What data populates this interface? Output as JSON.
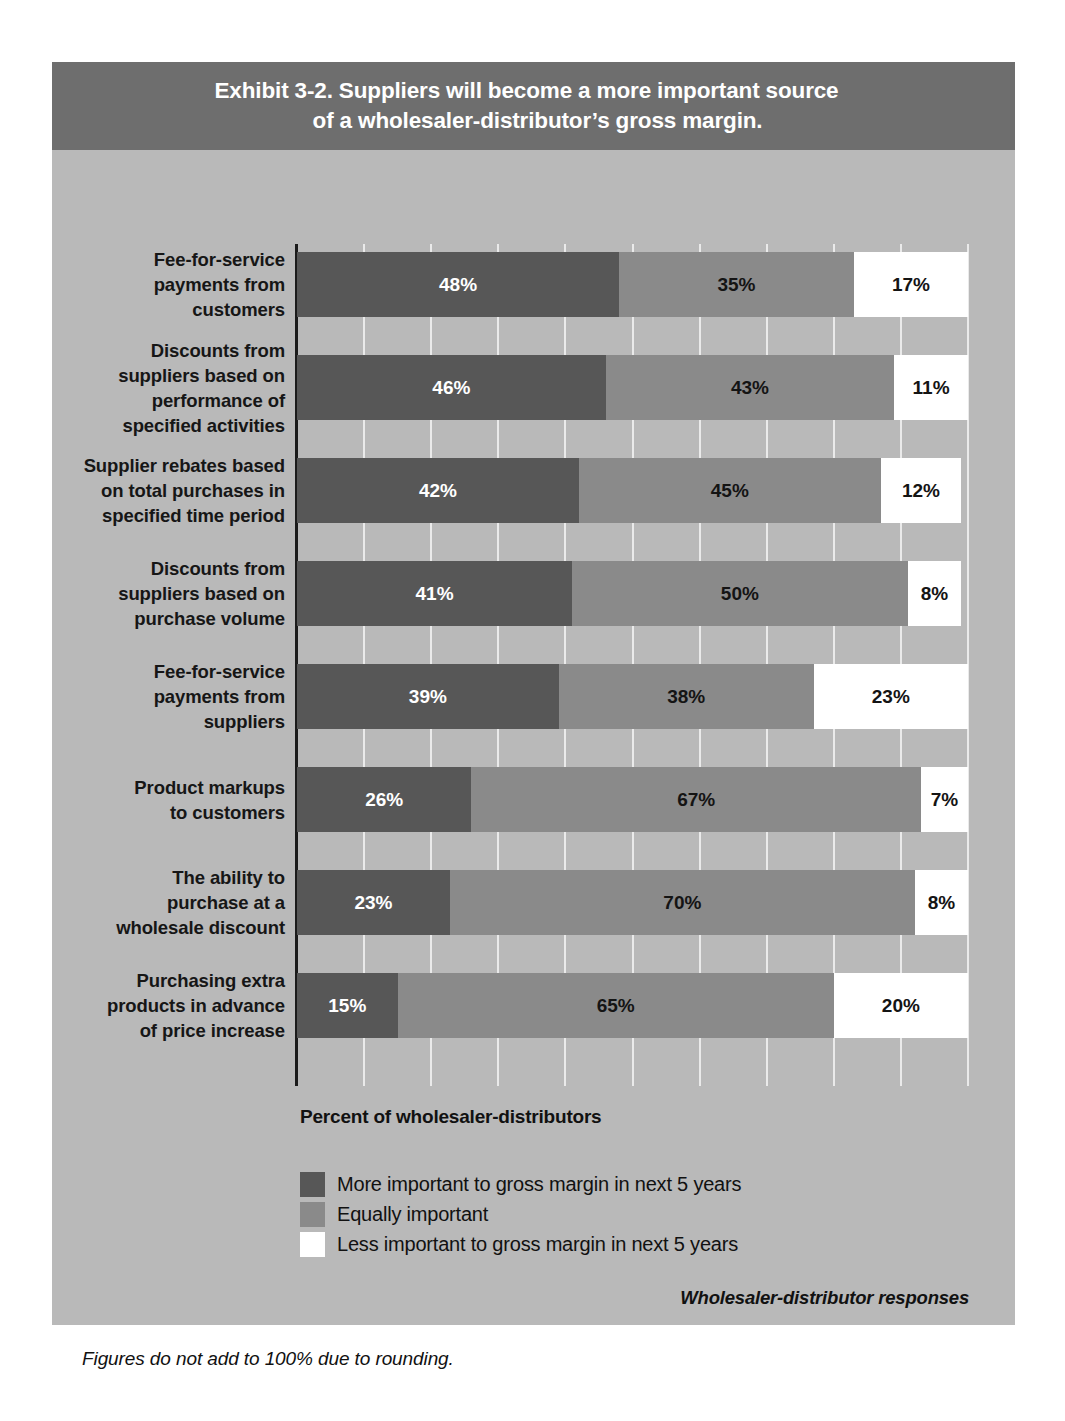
{
  "exhibit": {
    "title_line_1": "Exhibit 3-2. Suppliers will become a more important source",
    "title_line_2": "of a wholesaler-distributor’s gross margin.",
    "axis_caption": "Percent of wholesaler-distributors",
    "source_note": "Wholesaler-distributor responses",
    "rounding_note": "Figures do not add to 100% due to rounding."
  },
  "colors": {
    "panel_background": "#b9b9b9",
    "title_band": "#6e6e6e",
    "more_important": "#575757",
    "equally_important": "#8a8a8a",
    "less_important": "#ffffff",
    "gridline": "#eaeaea",
    "axis_line": "#1b1b1b"
  },
  "legend": {
    "items": [
      {
        "label": "More important to gross margin in next 5 years",
        "color": "#575757"
      },
      {
        "label": "Equally important",
        "color": "#8a8a8a"
      },
      {
        "label": "Less important to gross margin in next 5 years",
        "color": "#ffffff"
      }
    ]
  },
  "chart_data": {
    "type": "bar",
    "orientation": "horizontal",
    "stacked": true,
    "title": "Exhibit 3-2. Suppliers will become a more important source of a wholesaler-distributor’s gross margin.",
    "xlabel": "Percent of wholesaler-distributors",
    "ylabel": "",
    "xlim": [
      0,
      100
    ],
    "xtick_interval": 10,
    "grid": true,
    "legend_position": "bottom-left",
    "categories": [
      "Fee-for-service payments from customers",
      "Discounts from suppliers based on performance of specified activities",
      "Supplier rebates based on total purchases in specified time period",
      "Discounts from suppliers based on purchase volume",
      "Fee-for-service payments from suppliers",
      "Product markups to customers",
      "The ability to purchase at a wholesale discount",
      "Purchasing extra products in advance of price increase"
    ],
    "category_lines": [
      [
        "Fee-for-service",
        "payments from",
        "customers"
      ],
      [
        "Discounts from",
        "suppliers based on",
        "performance of",
        "specified activities"
      ],
      [
        "Supplier rebates based",
        "on total purchases in",
        "specified time period"
      ],
      [
        "Discounts from",
        "suppliers based on",
        "purchase volume"
      ],
      [
        "Fee-for-service",
        "payments from",
        "suppliers"
      ],
      [
        "Product markups",
        "to customers"
      ],
      [
        "The ability to",
        "purchase at a",
        "wholesale discount"
      ],
      [
        "Purchasing extra",
        "products in advance",
        "of price increase"
      ]
    ],
    "series": [
      {
        "name": "More important to gross margin in next 5 years",
        "color": "#575757",
        "values": [
          48,
          46,
          42,
          41,
          39,
          26,
          23,
          15
        ],
        "labels": [
          "48%",
          "46%",
          "42%",
          "41%",
          "39%",
          "26%",
          "23%",
          "15%"
        ]
      },
      {
        "name": "Equally important",
        "color": "#8a8a8a",
        "values": [
          35,
          43,
          45,
          50,
          38,
          67,
          70,
          65
        ],
        "labels": [
          "35%",
          "43%",
          "45%",
          "50%",
          "38%",
          "67%",
          "70%",
          "65%"
        ]
      },
      {
        "name": "Less important to gross margin in next 5 years",
        "color": "#ffffff",
        "values": [
          17,
          11,
          12,
          8,
          23,
          7,
          8,
          20
        ],
        "labels": [
          "17%",
          "11%",
          "12%",
          "8%",
          "23%",
          "7%",
          "8%",
          "20%"
        ]
      }
    ]
  }
}
